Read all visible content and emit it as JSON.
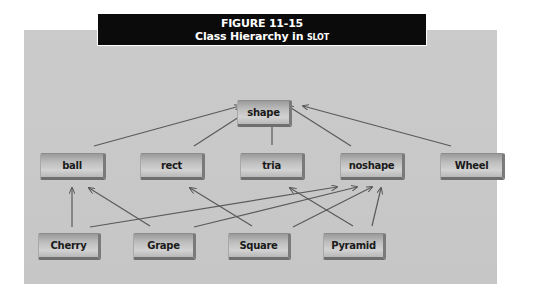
{
  "figure": {
    "number": "FIGURE 11-15",
    "caption_prefix": "Class Hierarchy in ",
    "caption_smallcaps": "SLOT"
  },
  "nodes": {
    "shape": "shape",
    "ball": "ball",
    "rect": "rect",
    "tria": "tria",
    "noshape": "noshape",
    "wheel": "Wheel",
    "cherry": "Cherry",
    "grape": "Grape",
    "square": "Square",
    "pyramid": "Pyramid"
  },
  "edges": [
    {
      "from": "ball",
      "to": "shape"
    },
    {
      "from": "rect",
      "to": "shape"
    },
    {
      "from": "tria",
      "to": "shape"
    },
    {
      "from": "noshape",
      "to": "shape"
    },
    {
      "from": "Wheel",
      "to": "shape"
    },
    {
      "from": "Cherry",
      "to": "ball"
    },
    {
      "from": "Cherry",
      "to": "noshape"
    },
    {
      "from": "Grape",
      "to": "ball"
    },
    {
      "from": "Grape",
      "to": "noshape"
    },
    {
      "from": "Square",
      "to": "rect"
    },
    {
      "from": "Square",
      "to": "noshape"
    },
    {
      "from": "Pyramid",
      "to": "tria"
    },
    {
      "from": "Pyramid",
      "to": "noshape"
    }
  ],
  "colors": {
    "panel": "#c9c9c9",
    "title_bg": "#0b0b0b",
    "edge": "#555555"
  }
}
